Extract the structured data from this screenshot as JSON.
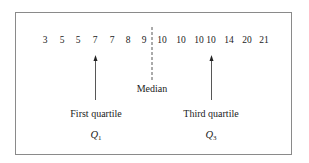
{
  "diagram": {
    "values": [
      "3",
      "5",
      "5",
      "7",
      "7",
      "8",
      "9",
      "10",
      "10",
      "10",
      "10",
      "14",
      "20",
      "21"
    ],
    "median_label": "Median",
    "first_quartile": {
      "label": "First quartile",
      "symbol": "Q",
      "subscript": "1",
      "points_to_value": "7",
      "index": 3
    },
    "third_quartile": {
      "label": "Third quartile",
      "symbol": "Q",
      "subscript": "3",
      "points_to_value": "10",
      "index": 10
    },
    "median_position": "between 9 and 10"
  }
}
